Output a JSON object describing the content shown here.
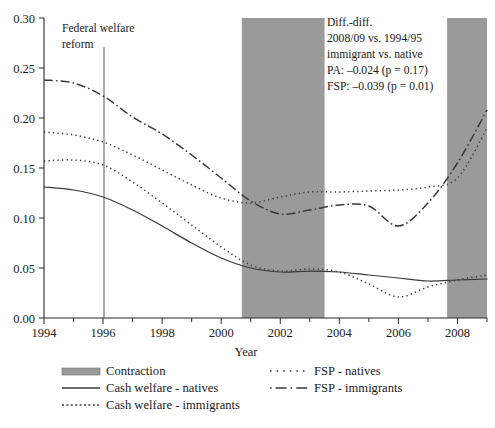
{
  "chart_data": {
    "type": "line",
    "title": "",
    "xlabel": "Year",
    "ylabel": "",
    "xlim": [
      1994,
      2009
    ],
    "ylim": [
      0.0,
      0.3
    ],
    "grid": false,
    "legend_position": "bottom",
    "ytick_labels": [
      "0.00",
      "0.05",
      "0.10",
      "0.15",
      "0.20",
      "0.25",
      "0.30"
    ],
    "ytick_values": [
      0.0,
      0.05,
      0.1,
      0.15,
      0.2,
      0.25,
      0.3
    ],
    "xtick_labels": [
      "1994",
      "1996",
      "1998",
      "2000",
      "2002",
      "2004",
      "2006",
      "2008"
    ],
    "xtick_values": [
      1994,
      1996,
      1998,
      2000,
      2002,
      2004,
      2006,
      2008
    ],
    "x": [
      1994,
      1995,
      1996,
      1997,
      1998,
      1999,
      2000,
      2001,
      2002,
      2003,
      2004,
      2005,
      2006,
      2007,
      2008,
      2009
    ],
    "series": [
      {
        "name": "Cash welfare - natives",
        "style": "solid",
        "values": [
          0.131,
          0.128,
          0.121,
          0.108,
          0.092,
          0.075,
          0.06,
          0.05,
          0.046,
          0.047,
          0.046,
          0.043,
          0.04,
          0.037,
          0.038,
          0.039
        ]
      },
      {
        "name": "Cash welfare - immigrants",
        "style": "dotted",
        "values": [
          0.157,
          0.158,
          0.153,
          0.136,
          0.115,
          0.093,
          0.071,
          0.053,
          0.047,
          0.049,
          0.046,
          0.034,
          0.021,
          0.031,
          0.038,
          0.043
        ]
      },
      {
        "name": "FSP - natives",
        "style": "dotted",
        "values": [
          0.186,
          0.183,
          0.176,
          0.163,
          0.148,
          0.133,
          0.12,
          0.115,
          0.121,
          0.126,
          0.126,
          0.127,
          0.128,
          0.131,
          0.14,
          0.19
        ]
      },
      {
        "name": "FSP - immigrants",
        "style": "dashdot",
        "values": [
          0.238,
          0.235,
          0.222,
          0.201,
          0.184,
          0.163,
          0.14,
          0.117,
          0.104,
          0.108,
          0.113,
          0.112,
          0.092,
          0.115,
          0.155,
          0.208
        ]
      }
    ],
    "shaded_regions": [
      {
        "name": "Contraction",
        "x0": 2000.7,
        "x1": 2003.5
      },
      {
        "name": "Contraction",
        "x0": 2007.65,
        "x1": 2009.15
      }
    ],
    "vertical_markers": [
      {
        "label_line1": "Federal welfare",
        "label_line2": "reform",
        "x": 1996.05
      }
    ],
    "annotations": [
      {
        "name": "diff-in-diff-box",
        "lines": [
          "Diff.-diff.",
          "2008/09 vs. 1994/95",
          "immigrant vs. native",
          "PA: –0.024 (p = 0.17)",
          "FSP: –0.039 (p = 0.01)"
        ]
      }
    ],
    "colors": {
      "contraction_fill": "#9a9a9a",
      "line": "#3a3a3a",
      "axis": "#2a2a2a",
      "background": "#ffffff"
    }
  },
  "legend": {
    "entries": [
      {
        "label": "Contraction",
        "marker": "swatch"
      },
      {
        "label": "Cash welfare - natives",
        "marker": "solid"
      },
      {
        "label": "Cash welfare - immigrants",
        "marker": "dotted"
      },
      {
        "label": "FSP - natives",
        "marker": "dotted-sparse"
      },
      {
        "label": "FSP - immigrants",
        "marker": "dashdot"
      }
    ]
  },
  "axis_title": {
    "x": "Year"
  },
  "reform_marker": {
    "line1": "Federal welfare",
    "line2": "reform"
  },
  "annotation_box": {
    "line1": "Diff.-diff.",
    "line2": "2008/09 vs. 1994/95",
    "line3": "immigrant vs. native",
    "line4": "PA: –0.024 (p = 0.17)",
    "line5": "FSP: –0.039 (p = 0.01)"
  }
}
